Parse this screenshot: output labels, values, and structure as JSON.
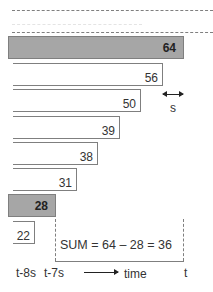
{
  "diagram": {
    "type": "sliding-window-sum",
    "bars": [
      {
        "value": "64",
        "style": "gray",
        "left": 8,
        "right": 184,
        "top": 36,
        "bottom": 59
      },
      {
        "value": "56",
        "style": "white",
        "left": 13,
        "right": 163,
        "top": 63,
        "bottom": 86
      },
      {
        "value": "50",
        "style": "white",
        "left": 13,
        "right": 141,
        "top": 89,
        "bottom": 112
      },
      {
        "value": "39",
        "style": "white",
        "left": 13,
        "right": 120,
        "top": 116,
        "bottom": 139
      },
      {
        "value": "38",
        "style": "white",
        "left": 13,
        "right": 98,
        "top": 142,
        "bottom": 165
      },
      {
        "value": "31",
        "style": "white",
        "left": 13,
        "right": 77,
        "top": 168,
        "bottom": 191
      },
      {
        "value": "28",
        "style": "gray",
        "left": 8,
        "right": 56,
        "top": 194,
        "bottom": 217
      },
      {
        "value": "22",
        "style": "white",
        "left": 13,
        "right": 35,
        "top": 221,
        "bottom": 244
      }
    ],
    "step_marker": {
      "label": "s"
    },
    "sum_label": "SUM = 64 – 28 = 36",
    "axis": {
      "labels": [
        "t-8s",
        "t-7s",
        "time",
        "t"
      ]
    },
    "colors": {
      "gray_fill": "#a6a6a6",
      "border": "#7f7f7f",
      "text": "#333333"
    }
  }
}
